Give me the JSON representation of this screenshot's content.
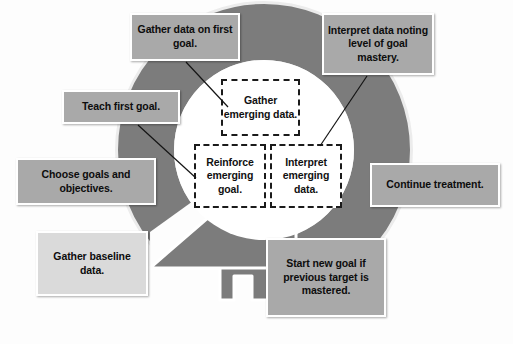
{
  "diagram": {
    "cycle": {
      "shape": "circular-arrow",
      "direction": "counter-clockwise",
      "ring_color": "#7c7c7c",
      "ring_outline_color": "#e8e8e8",
      "inner_circle_color": "#ffffff"
    },
    "phases": [
      {
        "id": "gather-emerging-data",
        "label": "Gather emerging data.",
        "position": "top-center"
      },
      {
        "id": "reinforce-emerging-goal",
        "label": "Reinforce emerging goal.",
        "position": "middle-left"
      },
      {
        "id": "interpret-emerging-data",
        "label": "Interpret emerging data.",
        "position": "middle-right"
      }
    ],
    "callouts": [
      {
        "id": "gather-data-first-goal",
        "label": "Gather data on first goal.",
        "fill": "#a9a9a9",
        "has_connector": true
      },
      {
        "id": "interpret-data-goal-mastery",
        "label": "Interpret data noting level of goal mastery.",
        "fill": "#a9a9a9",
        "has_connector": true
      },
      {
        "id": "teach-first-goal",
        "label": "Teach first goal.",
        "fill": "#a9a9a9",
        "has_connector": true
      },
      {
        "id": "choose-goals-objectives",
        "label": "Choose goals and objectives.",
        "fill": "#a9a9a9",
        "has_connector": false
      },
      {
        "id": "gather-baseline-data",
        "label": "Gather baseline data.",
        "fill": "#dadada",
        "has_connector": false
      },
      {
        "id": "continue-treatment",
        "label": "Continue treatment.",
        "fill": "#a9a9a9",
        "has_connector": false
      },
      {
        "id": "start-new-goal",
        "label": "Start new goal if previous target is mastered.",
        "fill": "#a9a9a9",
        "has_connector": false
      }
    ]
  }
}
